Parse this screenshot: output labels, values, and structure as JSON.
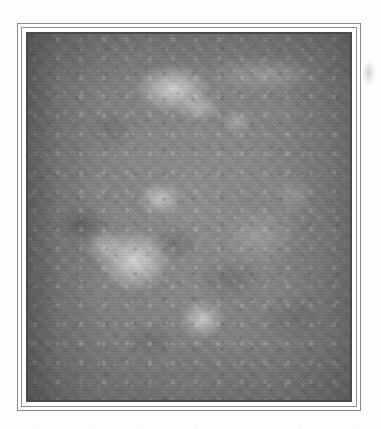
{
  "page": {
    "background_color": "#fdfdfc",
    "width": 381,
    "height": 429
  },
  "frame": {
    "style": "double-rule",
    "outer_rule_color": "#8b8b8b",
    "inner_rule_color": "#8f8f8f",
    "gap_color": "#ffffff",
    "bezel_color": "#4a4a4a",
    "left": 17,
    "top": 23,
    "width": 344,
    "height": 388
  },
  "photo": {
    "type": "grayscale-photograph",
    "subject": "clinical skin lesion close-up",
    "palette": {
      "mid_tone": "#8a8887",
      "highlight": "#efece9",
      "shadow": "#4a4a4a",
      "edge_dark": "#6f6e6d"
    },
    "texture": "halftone-screen",
    "highlights": [
      {
        "name": "top-centre-plaque",
        "x_pct": 45,
        "y_pct": 15
      },
      {
        "name": "upper-right-streak",
        "x_pct": 74,
        "y_pct": 11
      },
      {
        "name": "mid-left-nodule",
        "x_pct": 41,
        "y_pct": 45
      },
      {
        "name": "centre-left-cluster",
        "x_pct": 33,
        "y_pct": 62
      },
      {
        "name": "lower-centre-nodule",
        "x_pct": 54,
        "y_pct": 78
      },
      {
        "name": "mid-right-field",
        "x_pct": 72,
        "y_pct": 55
      }
    ],
    "vignette": "darker along left and right margins"
  },
  "artifacts": {
    "edge_smudge": {
      "name": "right-margin-smudge",
      "x": 362,
      "y": 62,
      "width": 13,
      "height": 24
    }
  },
  "caption": ""
}
